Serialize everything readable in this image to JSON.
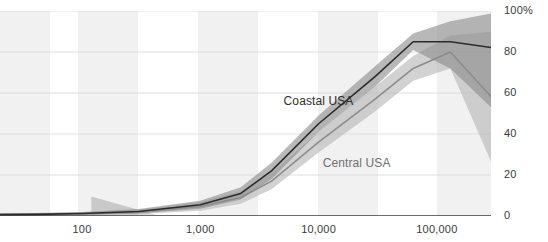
{
  "chart_data": {
    "type": "line",
    "title": "",
    "subtitle": "",
    "xlabel": "",
    "ylabel": "",
    "xscale": "log",
    "xlim": [
      12,
      300000
    ],
    "ylim": [
      0,
      100
    ],
    "xticks": [
      100,
      1000,
      10000,
      100000
    ],
    "xticklabels": [
      "100",
      "1,000",
      "10,000",
      "100,000"
    ],
    "yticks": [
      0,
      20,
      40,
      60,
      80,
      100
    ],
    "yticklabels": [
      "0",
      "20",
      "40",
      "60",
      "80",
      "100%"
    ],
    "grid": "horizontal",
    "legend_position": "inline-annotations",
    "band_shading": "alternating vertical decade bands",
    "series": [
      {
        "name": "Coastal USA",
        "color": "#2b2b2b",
        "band_color": "#8d8d8d",
        "label_x": 10000,
        "label_y": 56,
        "x": [
          12,
          40,
          100,
          300,
          1000,
          2200,
          4000,
          10000,
          30000,
          63000,
          130000,
          300000
        ],
        "values": [
          0.6,
          0.8,
          1.2,
          2.2,
          5.5,
          11,
          22,
          45,
          68,
          85,
          85,
          82
        ],
        "band_low": [
          0.2,
          0.3,
          0.6,
          1.2,
          3.5,
          8,
          18,
          41,
          63,
          81,
          72,
          52
        ],
        "band_high": [
          1.2,
          1.5,
          2.0,
          3.4,
          7.5,
          14,
          26,
          49,
          73,
          89,
          95,
          99
        ]
      },
      {
        "name": "Central USA",
        "color": "#8c8c8c",
        "band_color": "#b7b7b7",
        "label_x": 21000,
        "label_y": 26,
        "x": [
          12,
          40,
          100,
          300,
          1000,
          2200,
          4000,
          10000,
          30000,
          63000,
          130000,
          300000
        ],
        "values": [
          0.5,
          0.7,
          1.0,
          1.9,
          4.6,
          9,
          17,
          36,
          57,
          72,
          80,
          57
        ],
        "band_low": [
          0.1,
          0.2,
          0.4,
          0.9,
          2.6,
          6,
          13,
          31,
          51,
          66,
          72,
          24
        ],
        "band_high": [
          1.1,
          1.4,
          1.8,
          3.1,
          6.8,
          12,
          21,
          41,
          63,
          78,
          88,
          90
        ]
      }
    ],
    "extra_regions": [
      {
        "name": "low-end-uncertainty-wedge",
        "color": "#a8a8a8",
        "x": [
          120,
          120,
          420
        ],
        "upper": [
          9.5,
          9.5,
          0.6
        ],
        "lower": [
          0.6,
          0.6,
          0.6
        ]
      }
    ]
  },
  "labels": {
    "coastal": "Coastal USA",
    "central": "Central USA"
  },
  "topcaption": ""
}
